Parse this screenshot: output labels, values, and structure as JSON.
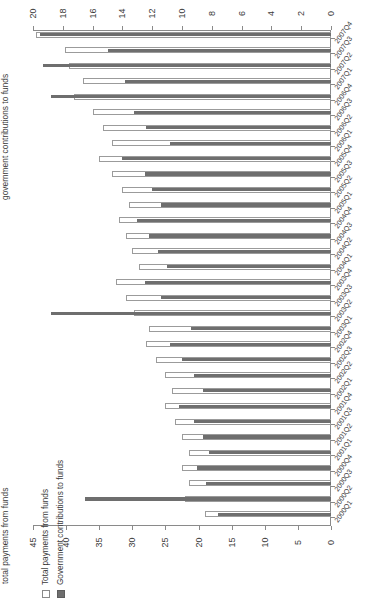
{
  "chart_data": {
    "type": "bar",
    "orientation": "horizontal",
    "title": "",
    "top_axis_label": "government contributions to funds",
    "bottom_axis_label": "total payments from funds",
    "top_axis": {
      "ticks": [
        20,
        18,
        16,
        14,
        12,
        10,
        8,
        6,
        4,
        2,
        0
      ],
      "lim": [
        20,
        0
      ],
      "reversed": true
    },
    "bottom_axis": {
      "ticks": [
        45,
        40,
        35,
        30,
        25,
        20,
        15,
        10,
        5,
        0
      ],
      "lim": [
        45,
        0
      ],
      "reversed": true
    },
    "grid": false,
    "legend_position": "left",
    "categories": [
      "2007Q4",
      "2007Q3",
      "2007Q2",
      "2007Q1",
      "2006Q4",
      "2006Q3",
      "2006Q2",
      "2006Q1",
      "2005Q4",
      "2005Q3",
      "2005Q2",
      "2005Q1",
      "2004Q4",
      "2004Q3",
      "2004Q2",
      "2004Q1",
      "2003Q4",
      "2003Q3",
      "2003Q2",
      "2003Q1",
      "2002Q4",
      "2002Q3",
      "2002Q2",
      "2002Q1",
      "2001Q4",
      "2001Q3",
      "2001Q2",
      "2001Q1",
      "2000Q4",
      "2000Q3",
      "2000Q2",
      "2000Q1"
    ],
    "series": [
      {
        "name": "Total payments from funds",
        "axis": "bottom",
        "color": "#ffffff",
        "edgecolor": "#9b9b9b",
        "values": [
          44.5,
          40.2,
          39.5,
          37.5,
          38.8,
          36.0,
          34.5,
          33.0,
          35.0,
          33.0,
          31.5,
          30.5,
          32.0,
          31.0,
          30.0,
          29.0,
          32.5,
          31.0,
          29.8,
          27.5,
          28.0,
          26.5,
          25.0,
          24.0,
          25.0,
          23.5,
          22.5,
          21.5,
          22.5,
          21.5,
          22.0,
          19.0
        ]
      },
      {
        "name": "Government contributions to funds",
        "axis": "top",
        "color": "#6e6e6e",
        "values": [
          19.5,
          15.0,
          19.3,
          13.8,
          18.8,
          13.2,
          12.4,
          10.8,
          14.0,
          12.5,
          12.0,
          11.4,
          13.0,
          12.2,
          11.6,
          11.0,
          12.5,
          11.4,
          18.8,
          9.4,
          10.8,
          10.0,
          9.2,
          8.6,
          10.2,
          9.2,
          8.6,
          8.2,
          9.0,
          8.4,
          16.5,
          7.6
        ]
      }
    ]
  },
  "legend": {
    "items": [
      {
        "label": "Total payments from funds",
        "swatch": "total"
      },
      {
        "label": "Government contributions to funds",
        "swatch": "gov"
      }
    ]
  },
  "colors": {
    "gov_bar": "#6e6e6e",
    "total_bar": "#ffffff",
    "total_bar_edge": "#9b9b9b",
    "axis": "#8a8a8a",
    "text": "#3a3a3a"
  }
}
